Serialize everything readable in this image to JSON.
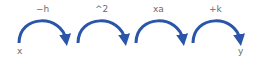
{
  "diagram": {
    "input_label": "x",
    "output_label": "y",
    "steps": [
      {
        "label": "−h"
      },
      {
        "label": "^2"
      },
      {
        "label": "xa"
      },
      {
        "label": "+k"
      }
    ],
    "arrow_color": "#2a55a8"
  }
}
